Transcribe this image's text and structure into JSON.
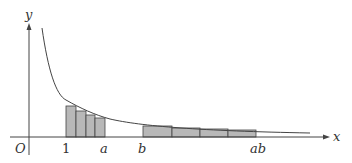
{
  "figure": {
    "axes": {
      "x_label": "x",
      "y_label": "y",
      "origin_label": "O"
    },
    "tick_labels": {
      "one": "1",
      "a": "a",
      "b": "b",
      "ab": "ab"
    },
    "curve": "y = 1/x",
    "colors": {
      "rect_fill": "#b8b8b8",
      "stroke": "#444444",
      "background": "#ffffff"
    },
    "left_rectangles": [
      {
        "x": 66,
        "w": 10,
        "top": 106
      },
      {
        "x": 76,
        "w": 10,
        "top": 111
      },
      {
        "x": 86,
        "w": 9,
        "top": 115
      },
      {
        "x": 95,
        "w": 10,
        "top": 118
      }
    ],
    "right_rectangles": [
      {
        "x": 143,
        "w": 29,
        "top": 126
      },
      {
        "x": 172,
        "w": 28,
        "top": 128
      },
      {
        "x": 200,
        "w": 28,
        "top": 129
      },
      {
        "x": 228,
        "w": 28,
        "top": 130
      }
    ]
  }
}
